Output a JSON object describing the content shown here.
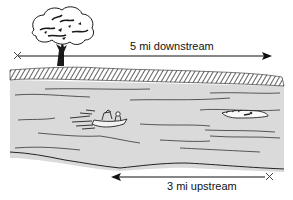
{
  "diagram": {
    "type": "river-current-word-problem-illustration",
    "downstream": {
      "label": "5 mi downstream",
      "direction": "right",
      "start_marker": "x-mark",
      "end_marker": "arrowhead"
    },
    "upstream": {
      "label": "3 mi upstream",
      "direction": "left",
      "start_marker": "x-mark",
      "end_marker": "arrowhead"
    },
    "elements": [
      "tree",
      "river-bank",
      "river",
      "motorboat",
      "crocodile"
    ],
    "colors": {
      "ink": "#111111",
      "water": "#d9d9d9",
      "bank_hatch": "#555555",
      "background": "#ffffff"
    }
  }
}
